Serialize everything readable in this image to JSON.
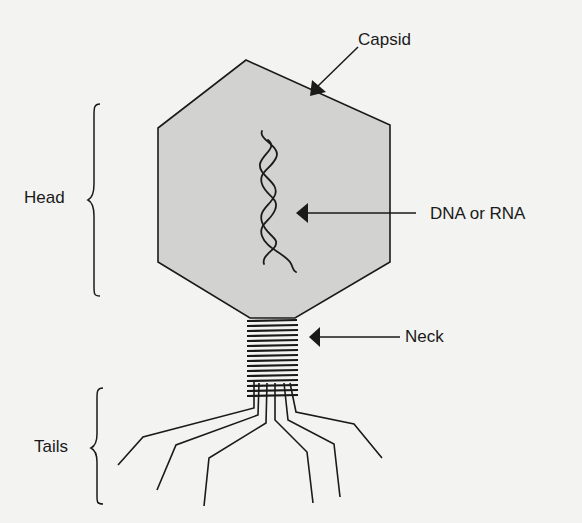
{
  "colors": {
    "background": "#f3f3f1",
    "capsid_fill": "#d2d2d0",
    "line": "#1a1a1a"
  },
  "labels": {
    "capsid": "Capsid",
    "head": "Head",
    "dna_rna": "DNA or RNA",
    "neck": "Neck",
    "tails": "Tails"
  },
  "parts": [
    {
      "name": "capsid",
      "shape": "hexagon"
    },
    {
      "name": "genetic-material",
      "shape": "double-helix"
    },
    {
      "name": "neck",
      "shape": "coiled-sheath"
    },
    {
      "name": "tail-fibers",
      "count": 6
    }
  ]
}
